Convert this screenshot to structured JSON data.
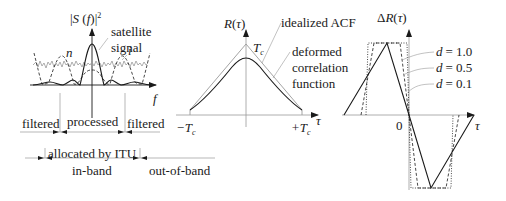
{
  "panel_spectrum": {
    "y_axis_label": "|S(f)|²",
    "x_axis_label": "f",
    "annotations": {
      "satellite_line1": "satellite",
      "satellite_line2": "signal",
      "noise": "n",
      "interference": "i"
    },
    "bands": {
      "filtered_left": "filtered",
      "processed": "processed",
      "filtered_right": "filtered",
      "allocated": "allocated by ITU",
      "in_band": "in-band",
      "out_of_band": "out-of-band"
    }
  },
  "panel_acf": {
    "y_axis_label": "R(τ)",
    "x_axis_label": "τ",
    "peak_label": "T",
    "peak_sub": "c",
    "left_tick": "−T",
    "right_tick": "+T",
    "tick_sub": "c",
    "annotations": {
      "ideal": "idealized ACF",
      "deformed_line1": "deformed",
      "deformed_line2": "correlation",
      "deformed_line3": "function"
    }
  },
  "panel_discriminator": {
    "y_axis_label": "ΔR(τ)",
    "x_axis_label": "τ",
    "origin_label": "0",
    "legend": [
      {
        "name": "d",
        "value": "= 1.0",
        "style": "solid"
      },
      {
        "name": "d",
        "value": "= 0.5",
        "style": "dashed"
      },
      {
        "name": "d",
        "value": "= 0.1",
        "style": "dotted"
      }
    ]
  },
  "colors": {
    "ink": "#1a1a1a",
    "grey": "#8c8c8c",
    "light_grey": "#b5b5b5"
  }
}
